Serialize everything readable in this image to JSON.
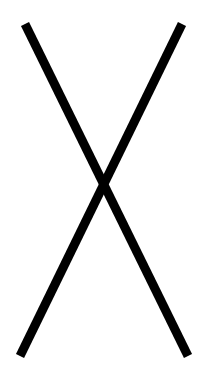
{
  "figure": {
    "background_color": "#ffffff",
    "stroke_color": "#000000",
    "stroke_width": 9,
    "lines": [
      {
        "name": "descending-stroke",
        "x1": 25,
        "y1": 24,
        "x2": 188,
        "y2": 356
      },
      {
        "name": "ascending-stroke",
        "x1": 182,
        "y1": 24,
        "x2": 20,
        "y2": 356
      }
    ]
  }
}
